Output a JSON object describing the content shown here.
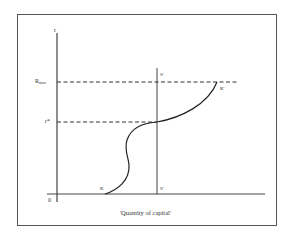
{
  "figure": {
    "y_axis_label": "r",
    "origin_label": "0",
    "rmax_label_main": "R",
    "rmax_label_sub": "max",
    "rstar_label": "r*",
    "s_top_label": "S'",
    "s_bottom_label": "S'",
    "k_bottom_label": "K",
    "k_top_label": "K'",
    "x_axis_caption": "'Quantity of capital'"
  },
  "colors": {
    "line": "#333333",
    "frame": "#555555",
    "background": "#ffffff"
  }
}
